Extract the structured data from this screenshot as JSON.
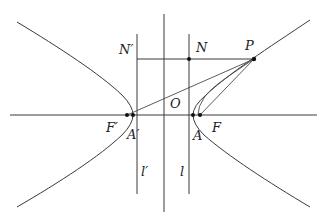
{
  "diagram": {
    "colors": {
      "stroke": "#3a3a3a",
      "point": "#111111",
      "label": "#222222",
      "background": "#ffffff"
    },
    "labels": {
      "N_prime": "N′",
      "N": "N",
      "P": "P",
      "O": "O",
      "F_prime": "F′",
      "A_prime": "A′",
      "A": "A",
      "F": "F",
      "l_prime": "l′",
      "l": "l"
    },
    "points": [
      {
        "name": "N",
        "x": 189,
        "y": 59
      },
      {
        "name": "P",
        "x": 254,
        "y": 59
      },
      {
        "name": "F′",
        "x": 127,
        "y": 115
      },
      {
        "name": "A′",
        "x": 133,
        "y": 115
      },
      {
        "name": "A",
        "x": 193,
        "y": 115
      },
      {
        "name": "F",
        "x": 200,
        "y": 115
      }
    ]
  }
}
